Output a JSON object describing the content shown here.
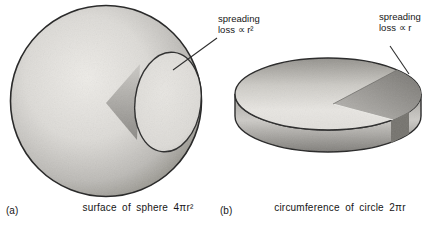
{
  "panel_a": {
    "letter": "(a)",
    "caption": "surface of sphere 4πr²",
    "callout_line1": "spreading",
    "callout_line2": "loss ∝ r²"
  },
  "panel_b": {
    "letter": "(b)",
    "caption": "circumference of circle 2πr",
    "callout_line1": "spreading",
    "callout_line2": "loss ∝ r"
  },
  "colors": {
    "outline": "#2a2a2a",
    "shade_light": "#eeece8",
    "shade_dark": "#7b7975",
    "background": "#ffffff",
    "text": "#161616"
  }
}
